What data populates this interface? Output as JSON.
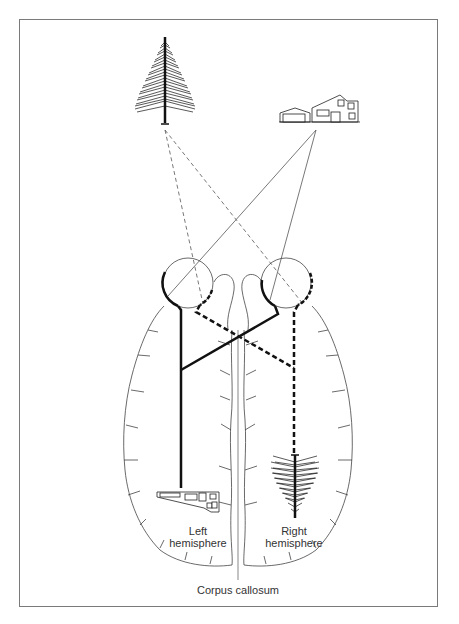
{
  "figure": {
    "labels": {
      "left_hemisphere": [
        "Left",
        "hemisphere"
      ],
      "right_hemisphere": [
        "Right",
        "hemisphere"
      ],
      "corpus_callosum": "Corpus callosum"
    },
    "objects": {
      "tree": "tree-icon",
      "house": "house-icon"
    },
    "colors": {
      "frame": "#7a7a7a",
      "ink": "#111111",
      "thin_line": "#555555",
      "text": "#333333"
    }
  }
}
